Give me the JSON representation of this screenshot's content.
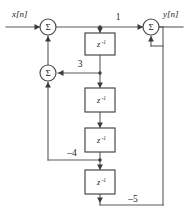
{
  "diagram": {
    "input_label": "x[n]",
    "output_label": "y[n]",
    "summer_symbol": "Σ",
    "delay_base": "z",
    "delay_exponent": "-1",
    "colors": {
      "wire": "#5a5a5a",
      "block_stroke": "#4a4a4a",
      "block_fill": "#ffffff",
      "text": "#1c1c1c",
      "background": "#ffffff"
    },
    "coefficients": {
      "feedforward_direct": "1",
      "tap_after_delay1": "3",
      "tap_after_delay3": "–4",
      "tap_after_delay4": "–5"
    },
    "summers": [
      {
        "id": "sum-input",
        "label": "Σ"
      },
      {
        "id": "sum-feedback",
        "label": "Σ"
      },
      {
        "id": "sum-output",
        "label": "Σ"
      }
    ],
    "delays": [
      {
        "id": "delay-1",
        "base": "z",
        "exp": "-1"
      },
      {
        "id": "delay-2",
        "base": "z",
        "exp": "-1"
      },
      {
        "id": "delay-3",
        "base": "z",
        "exp": "-1"
      },
      {
        "id": "delay-4",
        "base": "z",
        "exp": "-1"
      }
    ]
  }
}
